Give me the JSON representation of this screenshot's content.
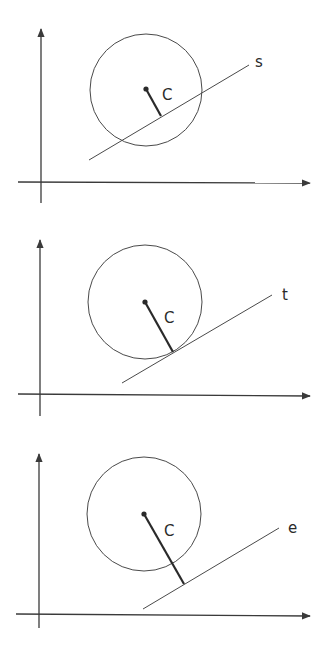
{
  "figure": {
    "colors": {
      "stroke": "#3a3a3a",
      "background": "#ffffff"
    },
    "panels": [
      {
        "id": "secant",
        "center_label": "C",
        "line_label": "s",
        "relation": "line intersects circle (secant)"
      },
      {
        "id": "tangent",
        "center_label": "C",
        "line_label": "t",
        "relation": "line touches circle (tangent)"
      },
      {
        "id": "external",
        "center_label": "C",
        "line_label": "e",
        "relation": "line outside circle (external)"
      }
    ]
  }
}
